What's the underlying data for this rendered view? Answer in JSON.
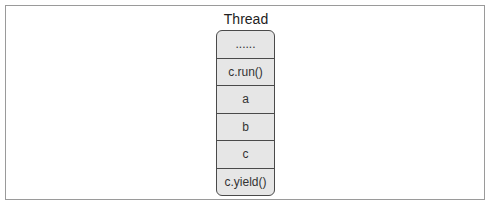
{
  "diagram": {
    "title": "Thread",
    "stack": [
      {
        "label": "......"
      },
      {
        "label": "c.run()"
      },
      {
        "label": "a"
      },
      {
        "label": "b"
      },
      {
        "label": "c"
      },
      {
        "label": "c.yield()"
      }
    ]
  }
}
